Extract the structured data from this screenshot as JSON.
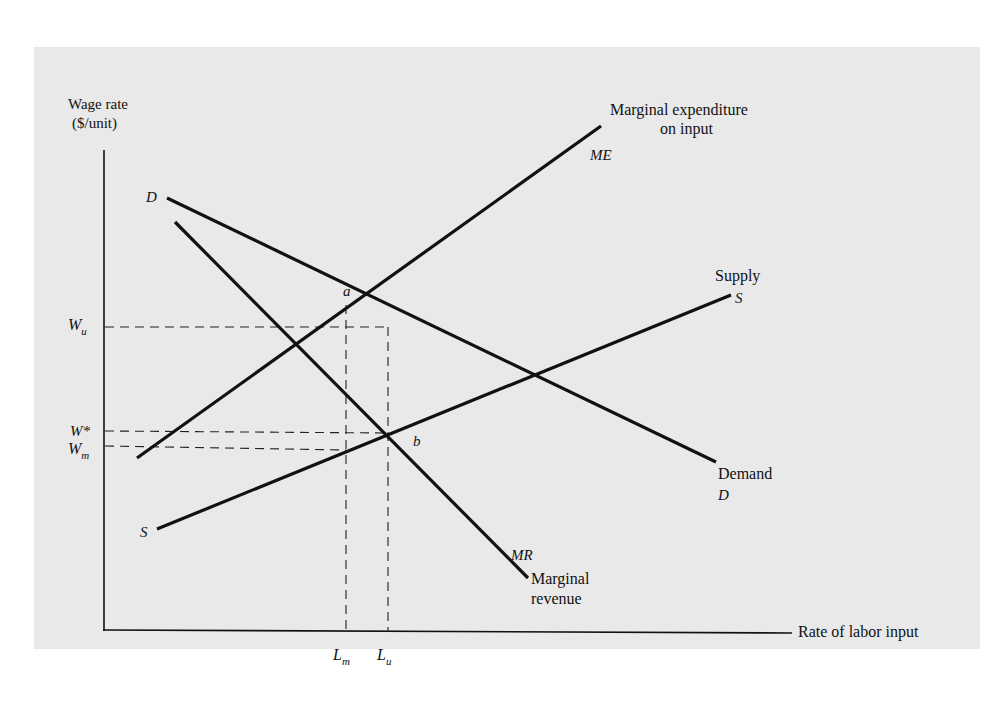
{
  "colors": {
    "page_background": "#ffffff",
    "panel_background": "#e9e9e9",
    "ink": "#111111"
  },
  "axes": {
    "y_label_line1": "Wage rate",
    "y_label_line2": "($/unit)",
    "x_label": "Rate of labor input"
  },
  "curves": {
    "marginal_expenditure": {
      "label_line1": "Marginal expenditure",
      "label_line2": "on input",
      "symbol": "ME"
    },
    "demand": {
      "label": "Demand",
      "symbol_start": "D",
      "symbol_end": "D"
    },
    "marginal_revenue": {
      "label_line1": "Marginal",
      "label_line2": "revenue",
      "symbol": "MR"
    },
    "supply": {
      "label": "Supply",
      "symbol_start": "S",
      "symbol_end": "S"
    }
  },
  "points": {
    "a": "a",
    "b": "b"
  },
  "y_ticks": {
    "wu_main": "W",
    "wu_sub": "u",
    "wstar": "W*",
    "wm_main": "W",
    "wm_sub": "m"
  },
  "x_ticks": {
    "lm_main": "L",
    "lm_sub": "m",
    "lu_main": "L",
    "lu_sub": "u"
  }
}
